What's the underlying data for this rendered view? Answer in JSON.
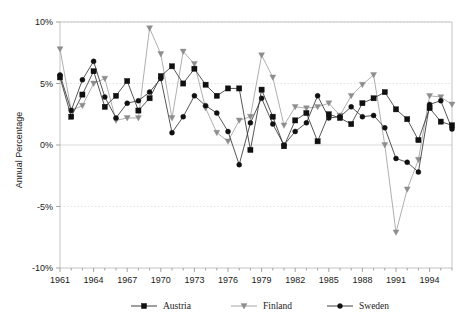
{
  "chart_data": {
    "type": "line",
    "title": "",
    "xlabel": "",
    "ylabel": "Annual Percentage",
    "ylim": [
      -10,
      10
    ],
    "xlim": [
      1961,
      1996
    ],
    "ytick_labels": [
      "10%",
      "5%",
      "0%",
      "-5%",
      "-10%"
    ],
    "ytick_values": [
      10,
      5,
      0,
      -5,
      -10
    ],
    "xtick_labels": [
      "1961",
      "1964",
      "1967",
      "1970",
      "1973",
      "1976",
      "1979",
      "1982",
      "1985",
      "1988",
      "1991",
      "1994"
    ],
    "xtick_values": [
      1961,
      1964,
      1967,
      1970,
      1973,
      1976,
      1979,
      1982,
      1985,
      1988,
      1991,
      1994
    ],
    "grid": "horizontal-dotted",
    "legend_position": "bottom",
    "x": [
      1961,
      1962,
      1963,
      1964,
      1965,
      1966,
      1967,
      1968,
      1969,
      1970,
      1971,
      1972,
      1973,
      1974,
      1975,
      1976,
      1977,
      1978,
      1979,
      1980,
      1981,
      1982,
      1983,
      1984,
      1985,
      1986,
      1987,
      1988,
      1989,
      1990,
      1991,
      1992,
      1993,
      1994,
      1995,
      1996
    ],
    "series": [
      {
        "name": "Austria",
        "color": "#101010",
        "marker": "square",
        "values": [
          5.5,
          2.3,
          4.1,
          6.0,
          3.1,
          4.0,
          5.2,
          2.8,
          3.8,
          5.6,
          6.4,
          5.0,
          6.2,
          4.9,
          4.0,
          4.6,
          4.6,
          -0.4,
          4.5,
          2.3,
          -0.1,
          2.0,
          2.6,
          0.3,
          2.5,
          2.2,
          1.7,
          3.4,
          3.8,
          4.3,
          2.9,
          2.1,
          0.4,
          3.0,
          1.9,
          1.6
        ]
      },
      {
        "name": "Finland",
        "color": "#8d8d8d",
        "marker": "triangle-down",
        "values": [
          7.8,
          2.8,
          3.2,
          5.0,
          5.4,
          2.0,
          2.2,
          2.2,
          9.5,
          7.4,
          2.2,
          7.6,
          6.6,
          3.0,
          1.0,
          0.3,
          2.0,
          2.3,
          7.3,
          5.5,
          1.6,
          3.1,
          3.0,
          3.1,
          3.4,
          2.4,
          4.0,
          4.9,
          5.7,
          0.0,
          -7.1,
          -3.6,
          -1.2,
          4.0,
          3.9,
          3.3
        ]
      },
      {
        "name": "Sweden",
        "color": "#101010",
        "marker": "circle",
        "values": [
          5.7,
          2.8,
          5.3,
          6.8,
          3.9,
          2.2,
          3.4,
          3.6,
          4.3,
          5.4,
          1.0,
          2.3,
          4.0,
          3.2,
          2.6,
          1.1,
          -1.6,
          1.8,
          3.8,
          1.7,
          0.0,
          1.1,
          1.8,
          4.0,
          2.2,
          2.3,
          3.1,
          2.3,
          2.4,
          1.4,
          -1.1,
          -1.4,
          -2.2,
          3.3,
          3.6,
          1.3
        ]
      }
    ]
  },
  "axis": {
    "ylabel": "Annual Percentage"
  },
  "legend": {
    "items": [
      {
        "label": "Austria",
        "marker": "square",
        "color": "#101010"
      },
      {
        "label": "Finland",
        "marker": "triangle-down",
        "color": "#8d8d8d"
      },
      {
        "label": "Sweden",
        "marker": "circle",
        "color": "#101010"
      }
    ]
  },
  "caption": {
    "text": ""
  }
}
